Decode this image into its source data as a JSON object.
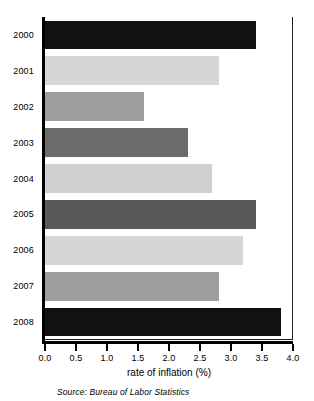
{
  "chart_data": {
    "type": "bar",
    "orientation": "horizontal",
    "title": "",
    "xlabel": "rate of inflation (%)",
    "ylabel": "",
    "categories": [
      "2000",
      "2001",
      "2002",
      "2003",
      "2004",
      "2005",
      "2006",
      "2007",
      "2008"
    ],
    "values": [
      3.4,
      2.8,
      1.6,
      2.3,
      2.7,
      3.4,
      3.2,
      2.8,
      3.8
    ],
    "bar_colors": [
      "#111111",
      "#d6d6d6",
      "#9e9e9e",
      "#6b6b6b",
      "#d0d0d0",
      "#595959",
      "#d6d6d6",
      "#9e9e9e",
      "#111111"
    ],
    "xlim": [
      0.0,
      4.0
    ],
    "ylim": null,
    "xticks": [
      0.0,
      0.5,
      1.0,
      1.5,
      2.0,
      2.5,
      3.0,
      3.5,
      4.0
    ],
    "xtick_labels": [
      "0.0",
      "0.5",
      "1.0",
      "1.5",
      "2.0",
      "2.5",
      "3.0",
      "3.5",
      "4.0"
    ],
    "grid": false,
    "legend": null,
    "annotations": [
      "Source: Bureau of Labor Statistics"
    ]
  },
  "axis": {
    "x_title": "rate of inflation (%)"
  },
  "footer": {
    "source": "Source: Bureau of Labor Statistics"
  }
}
